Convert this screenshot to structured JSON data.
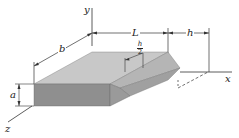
{
  "diagram": {
    "type": "3d-technical-drawing",
    "axes": {
      "x": "x",
      "y": "y",
      "z": "z"
    },
    "dimensions": {
      "b": "b",
      "L": "L",
      "h": "h",
      "a": "a",
      "h_half_num": "h",
      "h_half_den": "2"
    },
    "colors": {
      "top_face": "#c8c8c8",
      "front_face": "#8f8f8f",
      "side_face": "#a6a6a6",
      "wedge_top": "#b9b9b9",
      "wedge_front": "#9a9a9a",
      "line": "#333333"
    }
  }
}
